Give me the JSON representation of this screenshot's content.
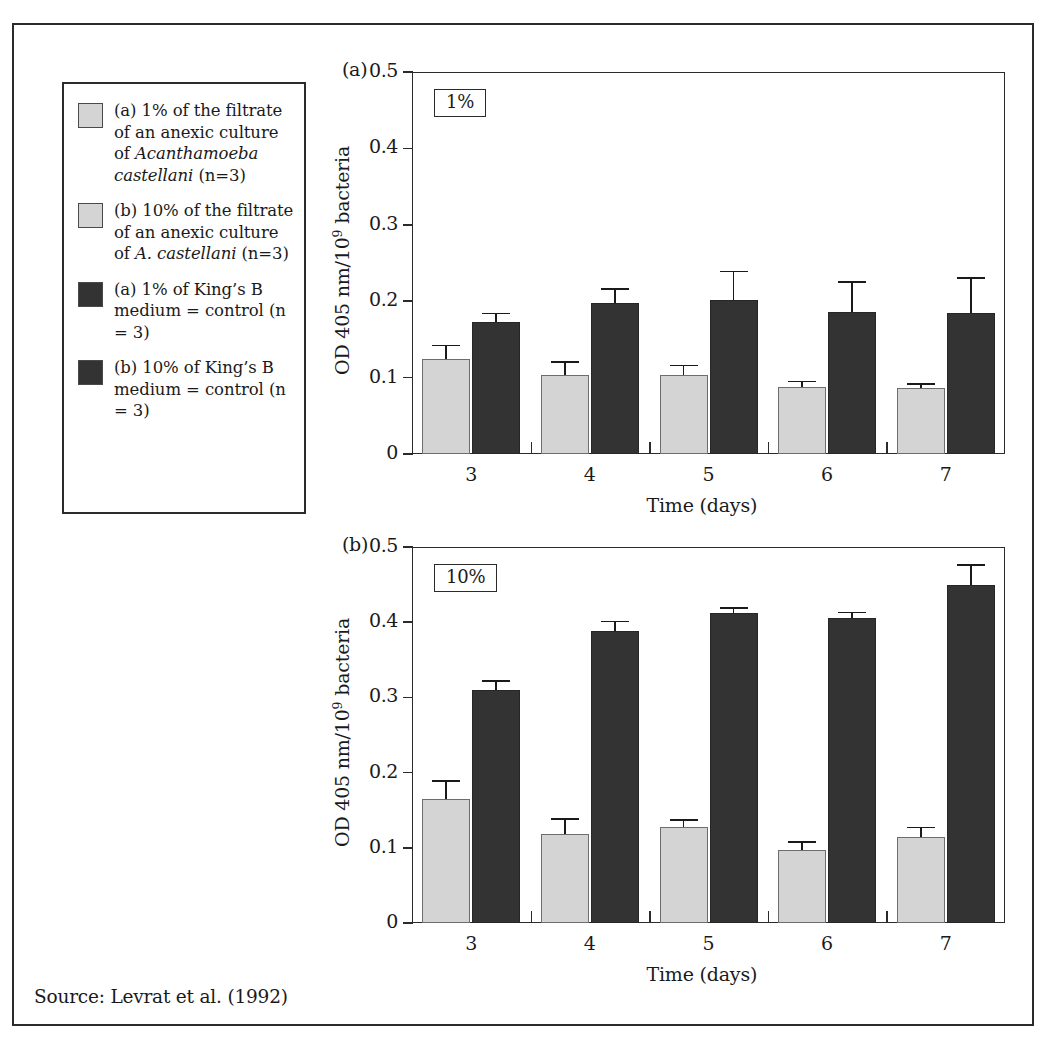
{
  "source_note": "Source: Levrat et al. (1992)",
  "legend": {
    "items": [
      {
        "swatch": "light",
        "swatch_color": "#d4d4d4",
        "text_parts": [
          {
            "t": "(a) 1% of the filtrate of an anexic culture of ",
            "italic": false
          },
          {
            "t": "Acanthamoeba castellani",
            "italic": true
          },
          {
            "t": " (n=3)",
            "italic": false
          }
        ],
        "plain": "(a) 1% of the filtrate of an anexic culture of Acanthamoeba castellani (n=3)"
      },
      {
        "swatch": "light",
        "swatch_color": "#d4d4d4",
        "text_parts": [
          {
            "t": "(b) 10% of the filtrate of an anexic culture of ",
            "italic": false
          },
          {
            "t": "A. castellani",
            "italic": true
          },
          {
            "t": " (n=3)",
            "italic": false
          }
        ],
        "plain": "(b) 10% of the filtrate of an anexic culture of A. castellani (n=3)"
      },
      {
        "swatch": "dark",
        "swatch_color": "#333333",
        "text_parts": [
          {
            "t": "(a) 1% of King’s B medium = control (n = 3)",
            "italic": false
          }
        ],
        "plain": "(a) 1% of King’s B medium = control (n = 3)"
      },
      {
        "swatch": "dark",
        "swatch_color": "#333333",
        "text_parts": [
          {
            "t": "(b) 10% of King’s B medium = control (n = 3)",
            "italic": false
          }
        ],
        "plain": "(b) 10% of King’s B medium = control (n = 3)"
      }
    ]
  },
  "chart_data": [
    {
      "type": "bar",
      "panel_tag": "(a)",
      "badge": "1%",
      "title": "",
      "xlabel": "Time (days)",
      "ylabel": "OD 405 nm/10⁹ bacteria",
      "ylabel_prefix": "OD 405 nm/10",
      "ylabel_exponent": "9",
      "ylabel_suffix": " bacteria",
      "categories": [
        "3",
        "4",
        "5",
        "6",
        "7"
      ],
      "ylim": [
        0,
        0.5
      ],
      "yticks": [
        0,
        0.1,
        0.2,
        0.3,
        0.4,
        0.5
      ],
      "ytick_labels": [
        "0",
        "0.1",
        "0.2",
        "0.3",
        "0.4",
        "0.5"
      ],
      "grid": false,
      "legend_position": "external-left",
      "series": [
        {
          "name": "1% of the filtrate of an anexic culture of Acanthamoeba castellani",
          "color": "#d4d4d4",
          "style": "light",
          "values": [
            0.124,
            0.104,
            0.103,
            0.088,
            0.086
          ],
          "errors": [
            0.018,
            0.016,
            0.013,
            0.007,
            0.006
          ]
        },
        {
          "name": "1% of King’s B medium = control",
          "color": "#333333",
          "style": "dark",
          "values": [
            0.173,
            0.198,
            0.202,
            0.186,
            0.185
          ],
          "errors": [
            0.011,
            0.018,
            0.037,
            0.039,
            0.045
          ]
        }
      ]
    },
    {
      "type": "bar",
      "panel_tag": "(b)",
      "badge": "10%",
      "title": "",
      "xlabel": "Time (days)",
      "ylabel": "OD 405 nm/10⁹ bacteria",
      "ylabel_prefix": "OD 405 nm/10",
      "ylabel_exponent": "9",
      "ylabel_suffix": " bacteria",
      "categories": [
        "3",
        "4",
        "5",
        "6",
        "7"
      ],
      "ylim": [
        0,
        0.5
      ],
      "yticks": [
        0,
        0.1,
        0.2,
        0.3,
        0.4,
        0.5
      ],
      "ytick_labels": [
        "0",
        "0.1",
        "0.2",
        "0.3",
        "0.4",
        "0.5"
      ],
      "grid": false,
      "legend_position": "external-left",
      "series": [
        {
          "name": "10% of the filtrate of an anexic culture of A. castellani",
          "color": "#d4d4d4",
          "style": "light",
          "values": [
            0.165,
            0.119,
            0.127,
            0.097,
            0.115
          ],
          "errors": [
            0.024,
            0.019,
            0.01,
            0.011,
            0.012
          ]
        },
        {
          "name": "10% of King’s B medium = control",
          "color": "#333333",
          "style": "dark",
          "values": [
            0.31,
            0.388,
            0.412,
            0.406,
            0.45
          ],
          "errors": [
            0.012,
            0.013,
            0.007,
            0.007,
            0.026
          ]
        }
      ]
    }
  ]
}
